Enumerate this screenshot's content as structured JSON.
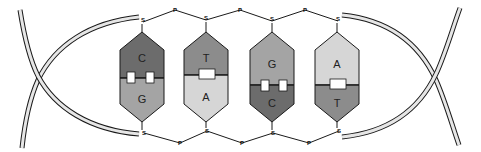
{
  "diagram": {
    "type": "dna-double-helix-base-pairs",
    "colors": {
      "background": "#ffffff",
      "outline": "#1a1a1a",
      "C": "#6c6c6c",
      "G": "#a4a4a4",
      "T": "#8c8c8c",
      "A": "#d6d6d6",
      "hydrogen_bond": "#ffffff",
      "backbone_fill": "#e6e6e6"
    },
    "top_strand": {
      "sugar_label": "S",
      "phosphate_label": "P",
      "sugars": [
        {
          "label": "S",
          "x": 143,
          "y": 22
        },
        {
          "label": "S",
          "x": 206,
          "y": 20
        },
        {
          "label": "S",
          "x": 272,
          "y": 21
        },
        {
          "label": "S",
          "x": 338,
          "y": 21
        }
      ],
      "phosphates": [
        {
          "label": "P",
          "x": 175,
          "y": 10
        },
        {
          "label": "P",
          "x": 240,
          "y": 10
        },
        {
          "label": "P",
          "x": 305,
          "y": 10
        }
      ]
    },
    "bottom_strand": {
      "sugar_label": "S",
      "phosphate_label": "P",
      "sugars": [
        {
          "label": "S",
          "x": 144,
          "y": 133
        },
        {
          "label": "S",
          "x": 207,
          "y": 131
        },
        {
          "label": "S",
          "x": 273,
          "y": 133
        },
        {
          "label": "S",
          "x": 339,
          "y": 131
        }
      ],
      "phosphates": [
        {
          "label": "P",
          "x": 180,
          "y": 143
        },
        {
          "label": "P",
          "x": 242,
          "y": 143
        },
        {
          "label": "P",
          "x": 309,
          "y": 143
        }
      ]
    },
    "base_pairs": [
      {
        "top": "C",
        "bottom": "G",
        "hydrogen_bonds": 3,
        "cx": 142,
        "bond_boxes": 2
      },
      {
        "top": "T",
        "bottom": "A",
        "hydrogen_bonds": 2,
        "cx": 206,
        "bond_boxes": 1
      },
      {
        "top": "G",
        "bottom": "C",
        "hydrogen_bonds": 3,
        "cx": 272,
        "bond_boxes": 2
      },
      {
        "top": "A",
        "bottom": "T",
        "hydrogen_bonds": 2,
        "cx": 337,
        "bond_boxes": 1
      }
    ]
  }
}
